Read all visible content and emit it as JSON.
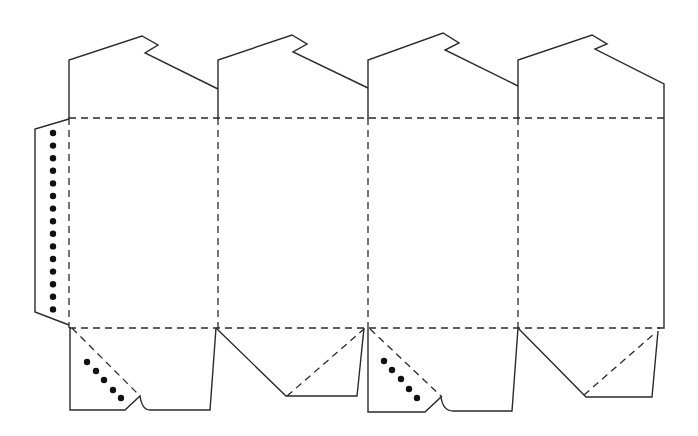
{
  "diagram": {
    "type": "box-dieline-template",
    "colors": {
      "cut_line": "#2a2a2a",
      "fold_line": "#2a2a2a",
      "glue_dot": "#111111",
      "background": "#ffffff"
    },
    "line_styles": {
      "cut": "solid",
      "fold": "dashed"
    },
    "panels": [
      {
        "id": "panel-1",
        "x_left": 69,
        "x_right": 218
      },
      {
        "id": "panel-2",
        "x_left": 218,
        "x_right": 368
      },
      {
        "id": "panel-3",
        "x_left": 368,
        "x_right": 518
      },
      {
        "id": "panel-4",
        "x_left": 518,
        "x_right": 664
      }
    ],
    "fold_lines": {
      "horizontal_top_y": 118,
      "horizontal_bottom_y": 328,
      "vertical_x": [
        69,
        218,
        368,
        518
      ]
    },
    "top_flaps": [
      {
        "id": "top-flap-1",
        "points": "69,119 69,60 142,36 158,45 145,53 218,89"
      },
      {
        "id": "top-flap-2",
        "points": "218,119 218,60 292,35 307,44 293,52 368,88"
      },
      {
        "id": "top-flap-3",
        "points": "368,119 368,60 443,33 459,43 445,50 518,86"
      },
      {
        "id": "top-flap-4",
        "points": "518,119 518,60 592,35 607,44 595,49 664,84 664,328 658,328"
      }
    ],
    "side_glue_tab": {
      "points": "69,119 35,129 35,312 69,325",
      "dot_count": 15,
      "dot_x": 53,
      "dot_y_start": 133,
      "dot_spacing": 12.6
    },
    "bottom_flaps": [
      {
        "id": "bottom-flap-1",
        "path": "M70,327 L70,410 L125,410 L140,396 Q142,410 150,410 L210,410 L216,328",
        "fold_diagonal": "72,328 140,396",
        "glue_dots": [
          [
            87,
            362
          ],
          [
            96,
            371
          ],
          [
            104,
            380
          ],
          [
            113,
            390
          ],
          [
            121,
            398
          ]
        ]
      },
      {
        "id": "bottom-flap-2",
        "path": "M216,328 L286,396 L357,396 L364,328",
        "fold_diagonal": "287,396 364,329",
        "glue_dots": []
      },
      {
        "id": "bottom-flap-3",
        "path": "M368,328 L368,412 L425,412 L441,397 Q443,411 453,411 L512,411 L518,328",
        "fold_diagonal": "370,329 442,397",
        "glue_dots": [
          [
            384,
            361
          ],
          [
            392,
            370
          ],
          [
            401,
            379
          ],
          [
            409,
            389
          ],
          [
            417,
            398
          ]
        ]
      },
      {
        "id": "bottom-flap-4",
        "path": "M518,328 L586,397 L652,397 L658,331",
        "fold_diagonal": "584,395 655,333",
        "glue_dots": []
      }
    ]
  }
}
